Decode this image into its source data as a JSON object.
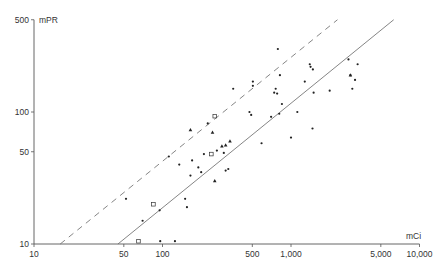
{
  "chart_data": {
    "type": "scatter",
    "title": "",
    "xlabel": "mCi",
    "ylabel": "mPR",
    "xscale": "log",
    "yscale": "log",
    "xlim": [
      10,
      10000
    ],
    "ylim": [
      10,
      500
    ],
    "grid": false,
    "legend": null,
    "x_ticks": [
      {
        "value": 10,
        "label": "10"
      },
      {
        "value": 50,
        "label": "50"
      },
      {
        "value": 100,
        "label": "100"
      },
      {
        "value": 500,
        "label": "500"
      },
      {
        "value": 1000,
        "label": "1,000"
      },
      {
        "value": 5000,
        "label": "5,000"
      },
      {
        "value": 10000,
        "label": "10,000"
      }
    ],
    "y_ticks": [
      {
        "value": 10,
        "label": "10"
      },
      {
        "value": 50,
        "label": "50"
      },
      {
        "value": 100,
        "label": "100"
      },
      {
        "value": 500,
        "label": "500"
      }
    ],
    "lines": [
      {
        "name": "regression-line",
        "style": "solid",
        "points": [
          [
            45,
            10
          ],
          [
            6300,
            500
          ]
        ]
      },
      {
        "name": "upper-limit-line",
        "style": "dashed",
        "points": [
          [
            16,
            10
          ],
          [
            2300,
            500
          ]
        ]
      }
    ],
    "series": [
      {
        "name": "dots",
        "marker": "dot",
        "points": [
          [
            52,
            22
          ],
          [
            70,
            15
          ],
          [
            95,
            18
          ],
          [
            96,
            10.5
          ],
          [
            125,
            10.5
          ],
          [
            112,
            46
          ],
          [
            135,
            40
          ],
          [
            150,
            22
          ],
          [
            155,
            19
          ],
          [
            165,
            33
          ],
          [
            170,
            43
          ],
          [
            190,
            38
          ],
          [
            200,
            35
          ],
          [
            210,
            48
          ],
          [
            225,
            82
          ],
          [
            265,
            51
          ],
          [
            300,
            49
          ],
          [
            310,
            36
          ],
          [
            325,
            37
          ],
          [
            355,
            150
          ],
          [
            475,
            100
          ],
          [
            490,
            95
          ],
          [
            505,
            170
          ],
          [
            505,
            158
          ],
          [
            590,
            58
          ],
          [
            700,
            92
          ],
          [
            740,
            140
          ],
          [
            760,
            150
          ],
          [
            780,
            138
          ],
          [
            790,
            300
          ],
          [
            810,
            97
          ],
          [
            820,
            190
          ],
          [
            850,
            115
          ],
          [
            1000,
            64
          ],
          [
            1120,
            100
          ],
          [
            1280,
            170
          ],
          [
            1400,
            230
          ],
          [
            1420,
            220
          ],
          [
            1480,
            210
          ],
          [
            1470,
            75
          ],
          [
            1500,
            140
          ],
          [
            2000,
            145
          ],
          [
            2800,
            250
          ],
          [
            2900,
            190
          ],
          [
            3000,
            150
          ],
          [
            3150,
            175
          ],
          [
            3300,
            230
          ]
        ]
      },
      {
        "name": "triangles",
        "marker": "triangle",
        "points": [
          [
            165,
            73
          ],
          [
            245,
            70
          ],
          [
            255,
            30
          ],
          [
            290,
            55
          ],
          [
            310,
            56
          ],
          [
            335,
            60
          ],
          [
            2900,
            190
          ]
        ]
      },
      {
        "name": "squares",
        "marker": "open-square",
        "points": [
          [
            65,
            10.5
          ],
          [
            85,
            20
          ],
          [
            240,
            48
          ],
          [
            255,
            93
          ]
        ]
      }
    ]
  }
}
